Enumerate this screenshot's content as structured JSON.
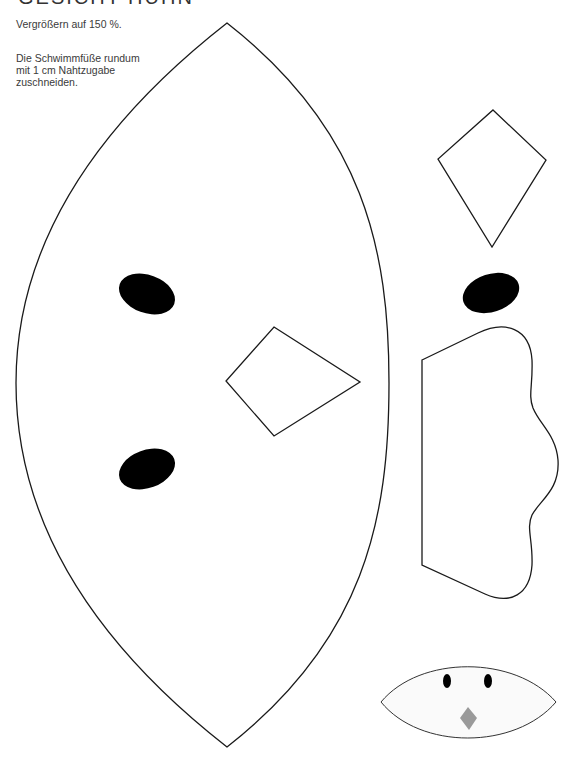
{
  "page": {
    "title": "GESICHT HÜHN",
    "instructions": [
      "Vergrößern auf 150 %.",
      "Die Schwimmfüße rundum mit 1 cm Nahtzugabe zuschneiden."
    ]
  },
  "pattern_pieces": [
    {
      "name": "head-body",
      "shape": "lens",
      "stroke": "#1a1a1a"
    },
    {
      "name": "eye-large",
      "count": 2,
      "fill": "#000000"
    },
    {
      "name": "beak-large",
      "shape": "kite",
      "stroke": "#1a1a1a"
    },
    {
      "name": "beak-small",
      "shape": "kite",
      "stroke": "#1a1a1a"
    },
    {
      "name": "eye-single",
      "fill": "#000000"
    },
    {
      "name": "webbed-foot",
      "shape": "foot",
      "stroke": "#1a1a1a"
    },
    {
      "name": "face-preview",
      "shape": "lens",
      "fill": "#fafafa",
      "beak_color": "#9a9a9a"
    }
  ]
}
